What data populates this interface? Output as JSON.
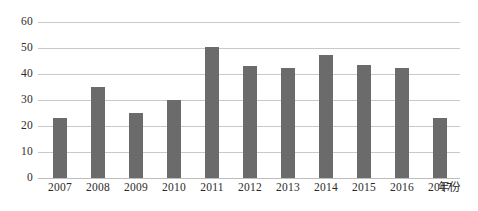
{
  "chart_data": {
    "type": "bar",
    "title": "",
    "subtitle": "",
    "xlabel": "年份",
    "ylabel": "",
    "categories": [
      "2007",
      "2008",
      "2009",
      "2010",
      "2011",
      "2012",
      "2013",
      "2014",
      "2015",
      "2016",
      "2017"
    ],
    "values": [
      23,
      35,
      25,
      30,
      50.5,
      43,
      42.5,
      47.5,
      43.5,
      42.5,
      23
    ],
    "series": [
      {
        "name": "",
        "values": [
          23,
          35,
          25,
          30,
          50.5,
          43,
          42.5,
          47.5,
          43.5,
          42.5,
          23
        ]
      }
    ],
    "ylim": [
      0,
      60
    ],
    "yticks": [
      0,
      10,
      20,
      30,
      40,
      50,
      60
    ],
    "ytick_labels": [
      "0",
      "10",
      "20",
      "30",
      "40",
      "50",
      "60"
    ],
    "grid": "horizontal",
    "legend": "none",
    "value_labels": "none",
    "bar_color": "#6b6b6b",
    "gridline_color": "#c9c9c9",
    "background_color": "#ffffff",
    "text_color": "#2b2b2b"
  }
}
